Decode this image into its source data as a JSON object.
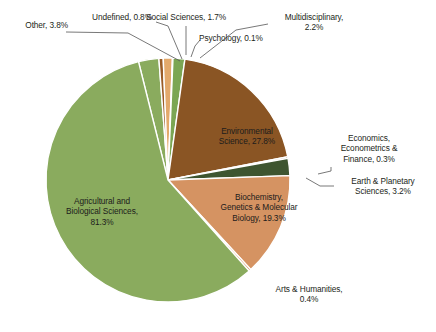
{
  "chart_data": {
    "type": "pie",
    "title": "",
    "subtitle": "",
    "xlabel": "",
    "ylabel": "",
    "legend_position": "none",
    "grid": false,
    "units": "%",
    "note": "Percentages are share of documents per subject area; a document may be assigned to several areas so the values sum to more than 100%.",
    "categories": [
      "Agricultural and Biological Sciences",
      "Environmental Science",
      "Biochemistry, Genetics & Molecular Biology",
      "Other",
      "Earth & Planetary Sciences",
      "Multidisciplinary",
      "Social Sciences",
      "Undefined",
      "Arts & Humanities",
      "Economics, Econometrics & Finance",
      "Psychology"
    ],
    "values": [
      81.3,
      27.8,
      19.3,
      3.8,
      3.2,
      2.2,
      1.7,
      0.8,
      0.4,
      0.3,
      0.1
    ],
    "colors": [
      "#8aab5e",
      "#8a5524",
      "#d59362",
      "#8aab5e",
      "#3e5530",
      "#7ba653",
      "#e3a96b",
      "#9a5c27",
      "#d59362",
      "#8a5524",
      "#8aab5e"
    ],
    "slices": [
      {
        "label": "Other",
        "value": 3.8,
        "text": "Other, 3.8%",
        "color": "#8aab5e"
      },
      {
        "label": "Undefined",
        "value": 0.8,
        "text": "Undefined, 0.8%",
        "color": "#9a5c27"
      },
      {
        "label": "Social Sciences",
        "value": 1.7,
        "text": "Social Sciences, 1.7%",
        "color": "#e3a96b"
      },
      {
        "label": "Psychology",
        "value": 0.1,
        "text": "Psychology, 0.1%",
        "color": "#8aab5e"
      },
      {
        "label": "Multidisciplinary",
        "value": 2.2,
        "text": "Multidisciplinary, 2.2%",
        "color": "#7ba653"
      },
      {
        "label": "Environmental Science",
        "value": 27.8,
        "text": "Environmental Science, 27.8%",
        "color": "#8a5524"
      },
      {
        "label": "Economics, Econometrics & Finance",
        "value": 0.3,
        "text": "Economics, Econometrics & Finance, 0.3%",
        "color": "#8a5524"
      },
      {
        "label": "Earth & Planetary Sciences",
        "value": 3.2,
        "text": "Earth & Planetary Sciences, 3.2%",
        "color": "#3e5530"
      },
      {
        "label": "Biochemistry, Genetics & Molecular Biology",
        "value": 19.3,
        "text": "Biochemistry, Genetics & Molecular Biology, 19.3%",
        "color": "#d59362"
      },
      {
        "label": "Arts & Humanities",
        "value": 0.4,
        "text": "Arts & Humanities, 0.4%",
        "color": "#d59362"
      },
      {
        "label": "Agricultural and Biological Sciences",
        "value": 81.3,
        "text": "Agricultural and Biological Sciences, 81.3%",
        "color": "#8aab5e"
      }
    ]
  },
  "labels": {
    "other": "Other, 3.8%",
    "undefined": "Undefined, 0.8%",
    "social_sciences": "Social Sciences, 1.7%",
    "psychology": "Psychology, 0.1%",
    "multidisciplinary": "Multidisciplinary,\n2.2%",
    "environmental_science": "Environmental\nScience, 27.8%",
    "economics": "Economics,\nEconometrics &\nFinance, 0.3%",
    "earth_planetary": "Earth & Planetary\nSciences, 3.2%",
    "biochemistry": "Biochemistry,\nGenetics & Molecular\nBiology, 19.3%",
    "agricultural": "Agricultural and\nBiological Sciences,\n81.3%",
    "arts_humanities": "Arts & Humanities,\n0.4%"
  }
}
